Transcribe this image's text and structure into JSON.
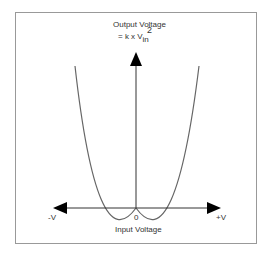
{
  "diagram": {
    "y_axis_label": "Output Voltage",
    "formula": {
      "prefix": "= k x V",
      "subscript": "in",
      "superscript": "2"
    },
    "x_axis_label": "Input Voltage",
    "x_tick_negative": "-V",
    "x_tick_zero": "0",
    "x_tick_positive": "+V",
    "colors": {
      "frame": "#999999",
      "axes": "#333333",
      "curve": "#666666",
      "arrowhead": "#000000"
    }
  }
}
